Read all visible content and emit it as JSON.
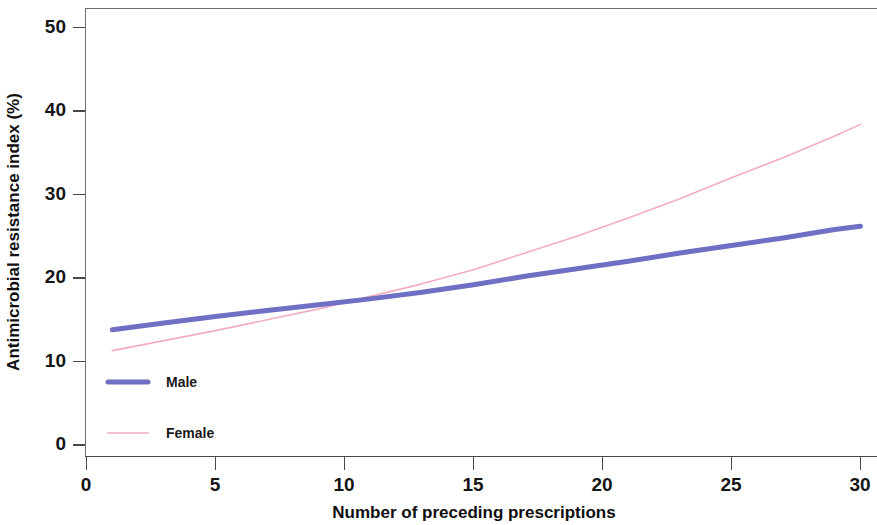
{
  "chart_data": {
    "type": "line",
    "title": "",
    "xlabel": "Number of preceding prescriptions",
    "ylabel": "Antimicrobial resistance index (%)",
    "xlim": [
      0,
      31
    ],
    "ylim": [
      0,
      52
    ],
    "xticks": [
      0,
      5,
      10,
      15,
      20,
      25,
      30
    ],
    "xticklabels": [
      "0",
      "5",
      "10",
      "15",
      "20",
      "25",
      "30"
    ],
    "yticks": [
      0,
      10,
      20,
      30,
      40,
      50
    ],
    "yticklabels": [
      "0",
      "10",
      "20",
      "30",
      "40",
      "50"
    ],
    "grid": false,
    "legend_position": "inside-lower-left",
    "series": [
      {
        "name": "Male",
        "color": "#6f6fc4",
        "linewidth": 5,
        "x": [
          1,
          3,
          5,
          7,
          9,
          11,
          13,
          15,
          17,
          19,
          21,
          23,
          25,
          27,
          29,
          30
        ],
        "values": [
          13.8,
          14.6,
          15.4,
          16.1,
          16.8,
          17.5,
          18.3,
          19.2,
          20.2,
          21.1,
          22.0,
          23.0,
          23.9,
          24.8,
          25.8,
          26.2
        ]
      },
      {
        "name": "Female",
        "color": "#f2adc4",
        "linewidth": 1.6,
        "x": [
          1,
          3,
          5,
          7,
          9,
          11,
          13,
          15,
          17,
          19,
          21,
          23,
          25,
          27,
          29,
          30
        ],
        "values": [
          11.3,
          12.5,
          13.7,
          15.0,
          16.3,
          17.8,
          19.3,
          21.0,
          23.0,
          25.0,
          27.2,
          29.5,
          32.0,
          34.4,
          37.0,
          38.4
        ]
      }
    ],
    "crossing_point": {
      "x": 9.2,
      "y": 16.9
    }
  },
  "axes": {
    "y_label": "Antimicrobial resistance index (%)",
    "x_label": "Number of preceding prescriptions"
  },
  "legend": {
    "entries": [
      {
        "label": "Male",
        "color": "#6f6fc4"
      },
      {
        "label": "Female",
        "color": "#f2adc4"
      }
    ]
  },
  "colors": {
    "male": "#6f6fc4",
    "female": "#f2adc4",
    "axis": "#4a4a4a",
    "frame": "#6e6e72",
    "text": "#151515",
    "background": "#ffffff"
  }
}
